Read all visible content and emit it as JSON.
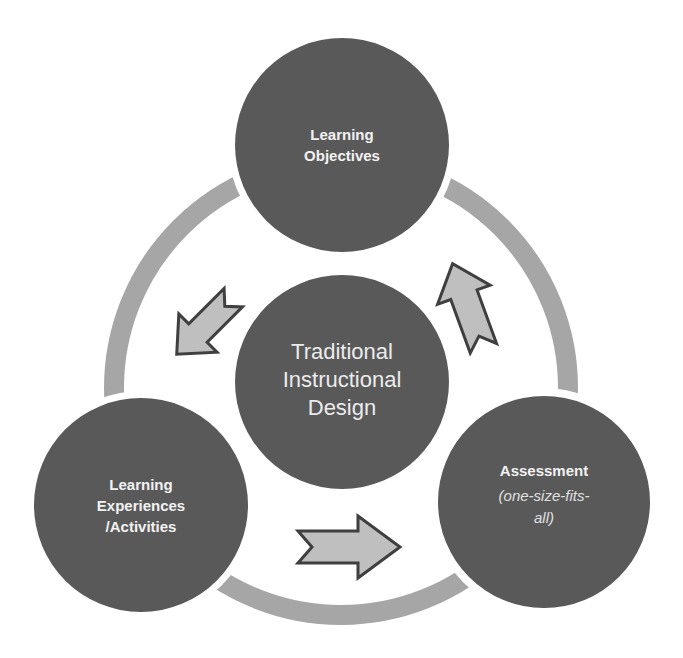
{
  "diagram": {
    "title": "Traditional Instructional Design",
    "colors": {
      "circle_fill": "#595959",
      "ring": "#a6a6a6",
      "arrow_fill": "#bfbfbf",
      "arrow_stroke": "#3f3f3f",
      "text": "#f2f2f2",
      "background": "#ffffff"
    },
    "center": {
      "lines": [
        "Traditional",
        "Instructional",
        "Design"
      ]
    },
    "nodes": [
      {
        "id": "objectives",
        "lines": [
          "Learning",
          "Objectives"
        ],
        "subtitle_lines": []
      },
      {
        "id": "assessment",
        "lines": [
          "Assessment"
        ],
        "subtitle_lines": [
          "(one-size-fits-",
          "all)"
        ]
      },
      {
        "id": "experiences",
        "lines": [
          "Learning",
          "Experiences",
          "/Activities"
        ],
        "subtitle_lines": []
      }
    ],
    "arrows": [
      {
        "from": "objectives",
        "to": "experiences",
        "direction": "down-left"
      },
      {
        "from": "experiences",
        "to": "assessment",
        "direction": "right"
      },
      {
        "from": "assessment",
        "to": "objectives",
        "direction": "up-right"
      }
    ]
  }
}
